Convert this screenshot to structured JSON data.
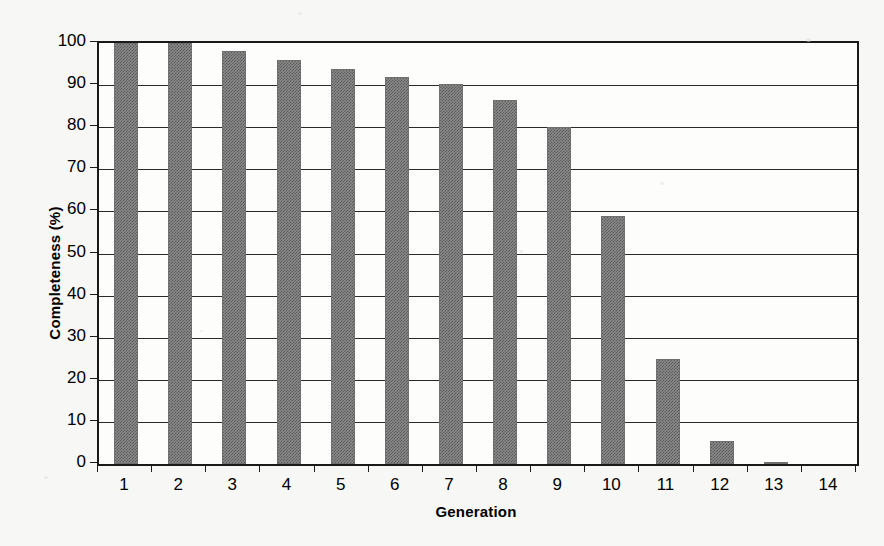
{
  "chart_data": {
    "type": "bar",
    "title": "",
    "xlabel": "Generation",
    "ylabel": "Completeness (%)",
    "categories": [
      "1",
      "2",
      "3",
      "4",
      "5",
      "6",
      "7",
      "8",
      "9",
      "10",
      "11",
      "12",
      "13",
      "14"
    ],
    "values": [
      100,
      100,
      98,
      96,
      93.8,
      92,
      90.2,
      86.5,
      80,
      59,
      25,
      5.5,
      0.5,
      0
    ],
    "xlim": [
      0,
      14
    ],
    "ylim": [
      0,
      100
    ],
    "ytick_labels": [
      "0",
      "10",
      "20",
      "30",
      "40",
      "50",
      "60",
      "70",
      "80",
      "90",
      "100"
    ],
    "ytick_values": [
      0,
      10,
      20,
      30,
      40,
      50,
      60,
      70,
      80,
      90,
      100
    ],
    "xtick_labels": [
      "1",
      "2",
      "3",
      "4",
      "5",
      "6",
      "7",
      "8",
      "9",
      "10",
      "11",
      "12",
      "13",
      "14"
    ],
    "grid": true,
    "grid_axis": "y",
    "legend": false,
    "legend_position": "none",
    "bar_color": "#8a8a8a",
    "axis_color": "#1a1a1a",
    "background_color": "#f7f7f5",
    "plot_background_color": "#fdfdfc"
  }
}
